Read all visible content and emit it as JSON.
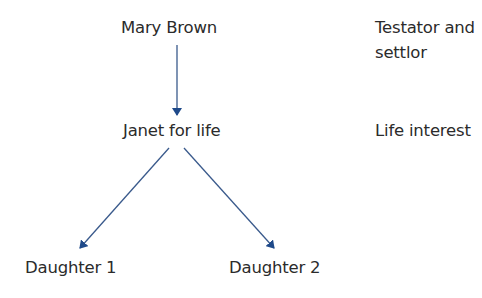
{
  "diagram": {
    "nodes": {
      "testator": "Mary Brown",
      "life_tenant": "Janet for life",
      "daughter1": "Daughter 1",
      "daughter2": "Daughter 2"
    },
    "annotations": {
      "testator_role_line1": "Testator and",
      "testator_role_line2": "settlor",
      "life_tenant_role": "Life interest"
    },
    "edges": [
      {
        "from": "Mary Brown",
        "to": "Janet for life"
      },
      {
        "from": "Janet for life",
        "to": "Daughter 1"
      },
      {
        "from": "Janet for life",
        "to": "Daughter 2"
      }
    ],
    "colors": {
      "arrow": "#3a5a8c",
      "arrowhead": "#1f4a8a",
      "text": "#2b2b2b"
    }
  }
}
